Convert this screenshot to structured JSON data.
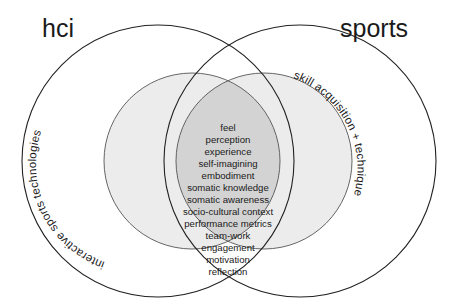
{
  "diagram": {
    "type": "venn",
    "sets": {
      "left": {
        "title": "hci",
        "inner_label": "interactive sports technologies"
      },
      "right": {
        "title": "sports",
        "inner_label": "skill acquisition + technique"
      }
    },
    "intersection_items": [
      "feel",
      "perception",
      "experience",
      "self-imagining",
      "embodiment",
      "somatic knowledge",
      "somatic awareness",
      "socio-cultural context",
      "performance metrics",
      "team-work",
      "engagement",
      "motivation",
      "reflection"
    ],
    "colors": {
      "outline": "#333333",
      "inner_fill": "#ebebeb",
      "overlap_fill": "#d4d4d4",
      "background": "#ffffff"
    }
  }
}
